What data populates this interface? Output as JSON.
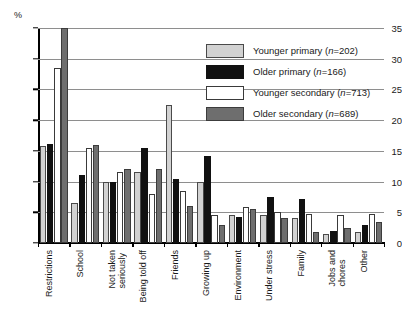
{
  "chart_data": {
    "type": "bar",
    "title": "",
    "xlabel": "",
    "ylabel": "%",
    "ylim": [
      0,
      35
    ],
    "yticks": [
      0,
      5,
      10,
      15,
      20,
      25,
      30,
      35
    ],
    "grid": true,
    "legend_position": "top-right",
    "categories": [
      "Restrictions",
      "School",
      "Not taken\nseriously",
      "Being told off",
      "Friends",
      "Growing up",
      "Environment",
      "Under stress",
      "Family",
      "Jobs and\nchores",
      "Other"
    ],
    "series": [
      {
        "name": "Younger primary (n=202)",
        "label_main": "Younger primary",
        "label_n": "n",
        "label_n_value": "=202",
        "color": "#d2d2d2",
        "values": [
          15.8,
          6.5,
          10.0,
          11.5,
          22.5,
          10.0,
          4.5,
          4.5,
          4.0,
          1.5,
          1.8
        ]
      },
      {
        "name": "Older primary (n=166)",
        "label_main": "Older primary",
        "label_n": "n",
        "label_n_value": "=166",
        "color": "#111111",
        "values": [
          16.2,
          11.0,
          10.0,
          15.5,
          10.5,
          14.2,
          4.3,
          7.5,
          7.2,
          2.0,
          3.0
        ]
      },
      {
        "name": "Younger secondary (n=713)",
        "label_main": "Younger secondary",
        "label_n": "n",
        "label_n_value": "=713",
        "color": "#ffffff",
        "values": [
          28.5,
          15.5,
          11.5,
          8.0,
          8.5,
          4.5,
          5.8,
          5.0,
          4.8,
          4.5,
          4.8
        ]
      },
      {
        "name": "Older secondary (n=689)",
        "label_main": "Older secondary",
        "label_n": "n",
        "label_n_value": "=689",
        "color": "#6e6e6e",
        "values": [
          35.0,
          16.0,
          12.0,
          12.0,
          6.0,
          3.0,
          5.5,
          4.0,
          1.8,
          2.5,
          3.5
        ]
      }
    ]
  }
}
